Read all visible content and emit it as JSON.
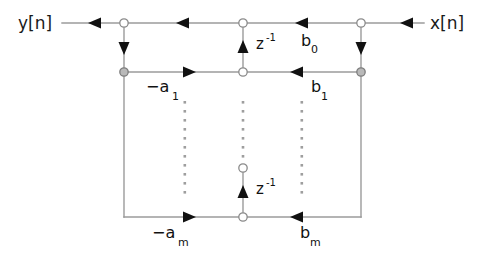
{
  "diagram": {
    "type": "signal-flow-graph",
    "background_color": "#ffffff",
    "wire_color": "#9b9b9b",
    "arrow_color": "#111111",
    "node_fill_open": "#ffffff",
    "node_fill_shaded": "#b9b9b9"
  },
  "signals": {
    "output_label": "y[n]",
    "input_label": "x[n]"
  },
  "delays": {
    "top": {
      "base": "z",
      "exponent": "-1"
    },
    "bottom": {
      "base": "z",
      "exponent": "-1"
    }
  },
  "coefficients": {
    "feedforward": [
      {
        "base": "b",
        "sub": "0",
        "label": "b_0"
      },
      {
        "base": "b",
        "sub": "1",
        "label": "b_1"
      },
      {
        "base": "b",
        "sub": "m",
        "label": "b_m"
      }
    ],
    "feedback": [
      {
        "base": "−a",
        "sub": "1",
        "label": "-a_1"
      },
      {
        "base": "−a",
        "sub": "m",
        "label": "-a_m"
      }
    ]
  },
  "ellipsis": {
    "glyph": "·",
    "columns": 3,
    "note": "vertical dotted continuation between first and last stage"
  }
}
